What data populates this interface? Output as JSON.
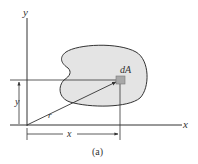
{
  "figure": {
    "caption": "(a)",
    "labels": {
      "y_axis": "y",
      "x_axis": "x",
      "element": "dA",
      "radius": "r",
      "y_dim": "y",
      "x_dim": "x"
    },
    "colors": {
      "line": "#333333",
      "region_fill": "#e4e4e4",
      "element_fill": "#a8a8a8"
    }
  }
}
